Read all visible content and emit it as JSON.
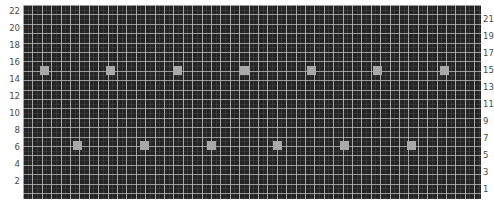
{
  "chart_data": {
    "type": "scatter",
    "title": "",
    "subtitle": "",
    "xlabel": "",
    "ylabel": "",
    "y2label": "",
    "grid": true,
    "legend": "none",
    "background_color": "#232323",
    "gridline_color": "#cdcdcd",
    "marker_color": "#a9a9a9",
    "marker_shape": "square",
    "axis_label_color": "#4a4a4a",
    "left_axis": {
      "ticks": [
        2,
        4,
        6,
        8,
        10,
        12,
        14,
        16,
        18,
        20,
        22
      ],
      "ylim": [
        1,
        23
      ]
    },
    "right_axis": {
      "ticks": [
        1,
        3,
        5,
        7,
        9,
        11,
        13,
        15,
        17,
        19,
        21
      ],
      "ylim": [
        1,
        23
      ],
      "clipped": true
    },
    "series": [
      {
        "name": "upper-row",
        "y_value": 15,
        "x": [
          2.2,
          9.2,
          16.2,
          23.2,
          30.2,
          37.2,
          44.2
        ],
        "values": [
          15,
          15,
          15,
          15,
          15,
          15,
          15
        ]
      },
      {
        "name": "lower-row",
        "y_value": 7,
        "x": [
          5.8,
          12.8,
          19.8,
          26.8,
          33.8,
          40.8
        ],
        "values": [
          7,
          7,
          7,
          7,
          7,
          7
        ]
      }
    ]
  },
  "markers": {
    "upper": [
      {
        "left": 40,
        "top": 66
      },
      {
        "left": 106,
        "top": 66
      },
      {
        "left": 173,
        "top": 66
      },
      {
        "left": 240,
        "top": 66
      },
      {
        "left": 307,
        "top": 66
      },
      {
        "left": 373,
        "top": 66
      },
      {
        "left": 440,
        "top": 66
      }
    ],
    "lower": [
      {
        "left": 73,
        "top": 141
      },
      {
        "left": 140,
        "top": 141
      },
      {
        "left": 207,
        "top": 141
      },
      {
        "left": 273,
        "top": 141
      },
      {
        "left": 340,
        "top": 141
      },
      {
        "left": 407,
        "top": 141
      }
    ]
  },
  "axis_layout": {
    "left_tick_tops": [
      7,
      24,
      41,
      58,
      75,
      92,
      109,
      126,
      143,
      160,
      177
    ],
    "right_tick_tops": [
      15,
      32,
      49,
      66,
      83,
      100,
      117,
      134,
      151,
      168,
      185
    ]
  }
}
